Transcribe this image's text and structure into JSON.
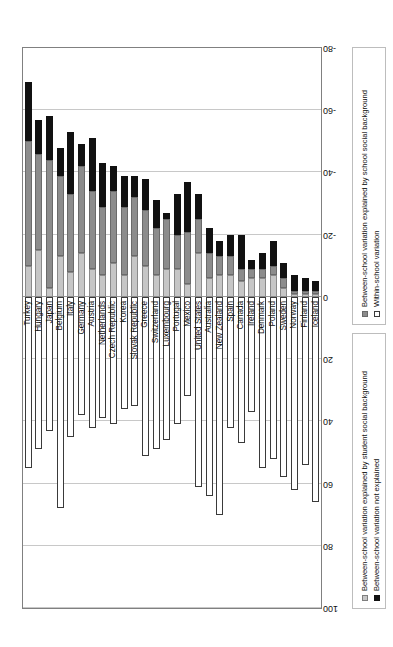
{
  "chart_data": {
    "type": "bar",
    "subtype": "stacked-diverging-horizontal",
    "title": "",
    "xlabel": "",
    "ylabel": "",
    "orientation": "horizontal",
    "rotated_180": true,
    "grid": true,
    "axis_ticks": [
      "100",
      "80",
      "60",
      "40",
      "20",
      "0",
      "-20",
      "-40",
      "-60",
      "-80"
    ],
    "axis_tick_values": [
      100,
      80,
      60,
      40,
      20,
      0,
      -20,
      -40,
      -60,
      -80
    ],
    "xlim": [
      100,
      -80
    ],
    "legend_position": "bottom",
    "series": [
      {
        "name": "Within-school variation",
        "key": "within",
        "color": "#ffffff"
      },
      {
        "name": "Between-school variation explained by student social background",
        "key": "student_bg",
        "color": "#c6c6c6"
      },
      {
        "name": "Between-school variation explained by school social background",
        "key": "school_bg",
        "color": "#8c8c8c"
      },
      {
        "name": "Between-school variation not explained",
        "key": "not_explained",
        "color": "#111111"
      }
    ],
    "categories": [
      "Turkey",
      "Hungary",
      "Japan",
      "Belgium",
      "Italy",
      "Germany",
      "Austria",
      "Netherlands",
      "Czech Republic",
      "Korea",
      "Slovak Republic",
      "Greece",
      "Switzerland",
      "Luxembourg",
      "Portugal",
      "Mexico",
      "United States",
      "Australia",
      "New Zealand",
      "Spain",
      "Canada",
      "Ireland",
      "Denmark",
      "Poland",
      "Sweden",
      "Norway",
      "Finland",
      "Iceland"
    ],
    "values": {
      "within": [
        55,
        49,
        43,
        68,
        45,
        38,
        42,
        39,
        41,
        36,
        35,
        51,
        49,
        46,
        41,
        32,
        61,
        64,
        70,
        42,
        47,
        37,
        55,
        52,
        58,
        62,
        54,
        66
      ],
      "student_bg": [
        10,
        15,
        3,
        13,
        8,
        14,
        9,
        7,
        11,
        7,
        13,
        10,
        7,
        9,
        9,
        4,
        14,
        6,
        7,
        7,
        5,
        6,
        6,
        7,
        3,
        1,
        1,
        1
      ],
      "school_bg": [
        40,
        31,
        41,
        26,
        25,
        28,
        25,
        22,
        23,
        22,
        19,
        18,
        15,
        16,
        11,
        17,
        11,
        8,
        6,
        6,
        4,
        3,
        3,
        3,
        3,
        1,
        1,
        1
      ],
      "not_explained": [
        19,
        11,
        14,
        9,
        20,
        7,
        17,
        14,
        8,
        10,
        7,
        10,
        9,
        2,
        13,
        16,
        8,
        8,
        5,
        7,
        11,
        3,
        5,
        8,
        5,
        5,
        4,
        3
      ]
    },
    "category_totals_negative": [
      69,
      57,
      58,
      48,
      53,
      49,
      51,
      43,
      42,
      39,
      39,
      38,
      31,
      27,
      33,
      37,
      33,
      22,
      18,
      20,
      20,
      12,
      14,
      18,
      11,
      7,
      6,
      5
    ]
  }
}
